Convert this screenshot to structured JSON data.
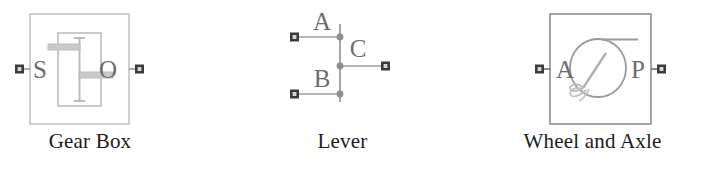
{
  "figure": {
    "background_color": "#ffffff",
    "line_color": "#b9b9b9",
    "port_color": "#3b3b3b",
    "label_color": "#6d6d6d",
    "caption_color": "#1c1c1c"
  },
  "blocks": [
    {
      "id": "gear-box",
      "caption": "Gear Box",
      "icon_name": "gear-box-icon",
      "ports": [
        {
          "id": "S",
          "label": "S",
          "side": "left"
        },
        {
          "id": "O",
          "label": "O",
          "side": "right"
        }
      ]
    },
    {
      "id": "lever",
      "caption": "Lever",
      "icon_name": "lever-icon",
      "ports": [
        {
          "id": "A",
          "label": "A",
          "side": "left"
        },
        {
          "id": "B",
          "label": "B",
          "side": "left"
        },
        {
          "id": "C",
          "label": "C",
          "side": "right"
        }
      ]
    },
    {
      "id": "wheel-and-axle",
      "caption": "Wheel and Axle",
      "icon_name": "wheel-and-axle-icon",
      "ports": [
        {
          "id": "A",
          "label": "A",
          "side": "left"
        },
        {
          "id": "P",
          "label": "P",
          "side": "right"
        }
      ]
    }
  ]
}
